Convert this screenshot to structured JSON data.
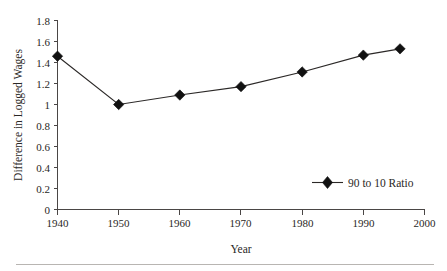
{
  "chart_data": {
    "type": "line",
    "title": "",
    "xlabel": "Year",
    "ylabel": "Difference in Logged Wages",
    "x": [
      1940,
      1950,
      1960,
      1970,
      1980,
      1990,
      1996
    ],
    "values": [
      1.46,
      1.0,
      1.09,
      1.17,
      1.31,
      1.47,
      1.53
    ],
    "series": [
      {
        "name": "90 to 10 Ratio",
        "values": [
          1.46,
          1.0,
          1.09,
          1.17,
          1.31,
          1.47,
          1.53
        ]
      }
    ],
    "xlim": [
      1940,
      2000
    ],
    "ylim": [
      0,
      1.8
    ],
    "xticks": [
      1940,
      1950,
      1960,
      1970,
      1980,
      1990,
      2000
    ],
    "xtick_labels": [
      "1940",
      "1950",
      "1960",
      "1970",
      "1980",
      "1990",
      "2000"
    ],
    "yticks": [
      0,
      0.2,
      0.4,
      0.6,
      0.8,
      1,
      1.2,
      1.4,
      1.6,
      1.8
    ],
    "ytick_labels": [
      "0",
      "0.2",
      "0.4",
      "0.6",
      "0.8",
      "1",
      "1.2",
      "1.4",
      "1.6",
      "1.8"
    ],
    "grid": false,
    "legend": {
      "position": "inside-lower-right",
      "entries": [
        "90 to 10 Ratio"
      ]
    },
    "marker": "diamond",
    "colors": {
      "line": "#2b2827",
      "marker": "#111111",
      "axis": "#4a4645",
      "text": "#2a2725",
      "background": "#ffffff",
      "footer_rule": "#b8b5b2"
    }
  },
  "labels": {
    "y_axis_title": "Difference in Logged Wages",
    "x_axis_title": "Year",
    "legend_entry": "90 to 10 Ratio",
    "y_1_8": "1.8",
    "y_1_6": "1.6",
    "y_1_4": "1.4",
    "y_1_2": "1.2",
    "y_1_0": "1",
    "y_0_8": "0.8",
    "y_0_6": "0.6",
    "y_0_4": "0.4",
    "y_0_2": "0.2",
    "y_0_0": "0",
    "x_1940": "1940",
    "x_1950": "1950",
    "x_1960": "1960",
    "x_1970": "1970",
    "x_1980": "1980",
    "x_1990": "1990",
    "x_2000": "2000"
  }
}
